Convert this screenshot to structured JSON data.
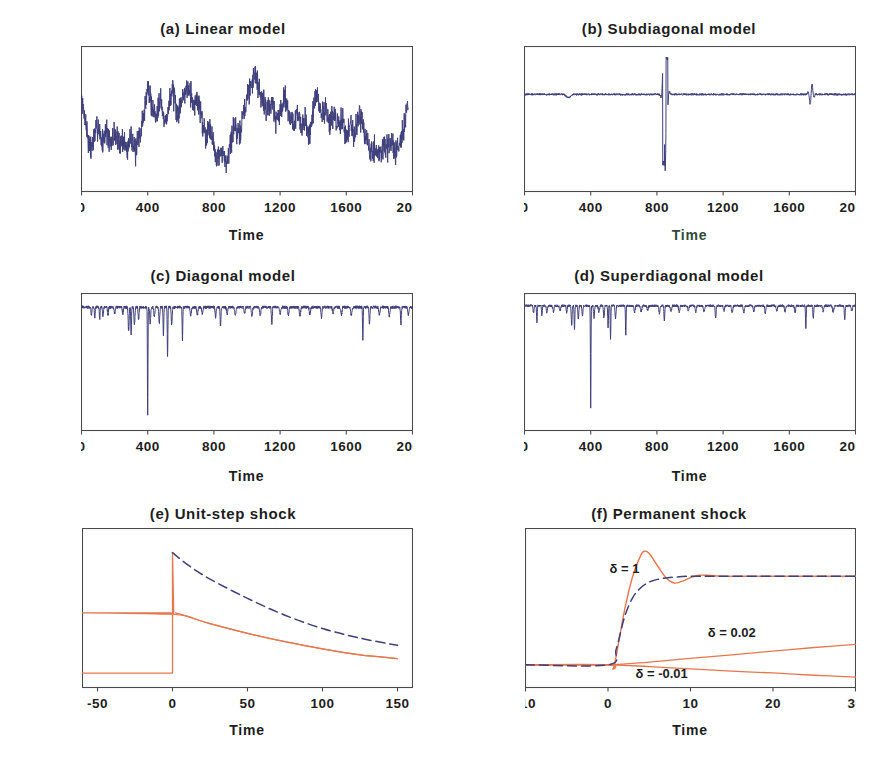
{
  "figure": {
    "background": "#ffffff",
    "series_colors": {
      "navy": "#3f3f7c",
      "orange": "#e8764c"
    }
  },
  "panels": [
    {
      "id": "a",
      "title": "(a) Linear model",
      "xlabel": "Time",
      "xticks": [
        "0",
        "400",
        "800",
        "1200",
        "1600",
        "2000"
      ],
      "yticks": [
        "20",
        "10",
        "0",
        "-10"
      ]
    },
    {
      "id": "b",
      "title": "(b) Subdiagonal model",
      "xlabel": "Time",
      "xticks": [
        "0",
        "400",
        "800",
        "1200",
        "1600",
        "2000"
      ],
      "yticks": [
        "200",
        "0",
        "-200",
        "-400",
        "-600"
      ]
    },
    {
      "id": "c",
      "title": "(c) Diagonal model",
      "xlabel": "Time",
      "xticks": [
        "0",
        "400",
        "800",
        "1200",
        "1600",
        "2000"
      ],
      "yticks": [
        "0",
        "-100",
        "-200",
        "-300",
        "-400"
      ]
    },
    {
      "id": "d",
      "title": "(d) Superdiagonal model",
      "xlabel": "Time",
      "xticks": [
        "0",
        "400",
        "800",
        "1200",
        "1600",
        "2000"
      ],
      "yticks": [
        "0",
        "-100",
        "-200",
        "-300",
        "-400",
        "-500"
      ]
    },
    {
      "id": "e",
      "title": "(e) Unit-step shock",
      "xlabel": "Time",
      "xticks": [
        "-50",
        "0",
        "50",
        "100",
        "150"
      ],
      "yticks": [
        "1.2",
        "1.0",
        "0.8",
        "0.6",
        "0.4",
        "0.2",
        "0.0"
      ]
    },
    {
      "id": "f",
      "title": "(f) Permanent shock",
      "xlabel": "Time",
      "xticks": [
        "-10",
        "0",
        "10",
        "20",
        "30"
      ],
      "yticks": [
        "3.0",
        "2.5",
        "2.0",
        "1.5",
        "1.0",
        "0.5",
        "0.0",
        "-0.5"
      ],
      "annotations": [
        {
          "text": "δ = 1",
          "x": 2.0,
          "y": 2.02
        },
        {
          "text": "δ = 0.02",
          "x": 15.0,
          "y": 0.62
        },
        {
          "text": "δ = -0.01",
          "x": 6.5,
          "y": -0.3
        }
      ]
    }
  ],
  "chart_data": [
    {
      "type": "line",
      "id": "a",
      "title": "(a) Linear model",
      "xlabel": "Time",
      "ylabel": "",
      "xlim": [
        0,
        2000
      ],
      "ylim": [
        -16,
        23
      ],
      "xticks": [
        0,
        400,
        800,
        1200,
        1600,
        2000
      ],
      "yticks": [
        20,
        10,
        0,
        -10
      ],
      "grid": false,
      "legend": "none",
      "series": [
        {
          "name": "linear model simulation",
          "color": "#3f3f7c",
          "style": "solid",
          "description": "Stationary random walk-like series oscillating roughly between -9 and +16 over 2000 time points.",
          "x": [
            0,
            25,
            50,
            75,
            100,
            125,
            150,
            175,
            200,
            225,
            250,
            275,
            300,
            325,
            350,
            375,
            400,
            425,
            450,
            475,
            500,
            525,
            550,
            575,
            600,
            625,
            650,
            675,
            700,
            725,
            750,
            775,
            800,
            825,
            850,
            875,
            900,
            925,
            950,
            975,
            1000,
            1025,
            1050,
            1075,
            1100,
            1125,
            1150,
            1175,
            1200,
            1225,
            1250,
            1275,
            1300,
            1325,
            1350,
            1375,
            1400,
            1425,
            1450,
            1475,
            1500,
            1525,
            1550,
            1575,
            1600,
            1625,
            1650,
            1675,
            1700,
            1725,
            1750,
            1775,
            1800,
            1825,
            1850,
            1875,
            1900,
            1925,
            1950,
            1975,
            2000
          ],
          "y": [
            8,
            3,
            -5,
            -2,
            2,
            -3,
            1,
            -4,
            0,
            -3,
            -2,
            -5,
            0,
            -6,
            -1,
            4,
            12,
            7,
            4,
            10,
            2,
            6,
            12,
            4,
            8,
            11,
            13,
            7,
            9,
            4,
            -1,
            2,
            -4,
            -7,
            -6,
            -8,
            -3,
            2,
            -2,
            4,
            9,
            13,
            16,
            11,
            8,
            6,
            9,
            3,
            5,
            10,
            6,
            2,
            5,
            1,
            3,
            -1,
            6,
            10,
            4,
            7,
            2,
            5,
            1,
            4,
            -2,
            3,
            -1,
            5,
            2,
            -3,
            -6,
            -4,
            -7,
            -3,
            -5,
            -2,
            -6,
            -2,
            2,
            7
          ]
        }
      ]
    },
    {
      "type": "line",
      "id": "b",
      "title": "(b) Subdiagonal model",
      "xlabel": "Time",
      "ylabel": "",
      "xlim": [
        0,
        2000
      ],
      "ylim": [
        -660,
        330
      ],
      "xticks": [
        0,
        400,
        800,
        1200,
        1600,
        2000
      ],
      "yticks": [
        200,
        0,
        -200,
        -400,
        -600
      ],
      "grid": false,
      "legend": "none",
      "series": [
        {
          "name": "subdiagonal model simulation",
          "color": "#3f3f7c",
          "style": "solid",
          "description": "Near-zero baseline with a large explosive burst near t=850 reaching -470 then +250, and a smaller burst near t=1730 reaching about +80.",
          "key_events": [
            {
              "t": 840,
              "value": -470,
              "label": "large negative spike"
            },
            {
              "t": 862,
              "value": 250,
              "label": "large positive spike"
            },
            {
              "t": 1730,
              "value": 80,
              "label": "secondary positive spike"
            }
          ]
        }
      ]
    },
    {
      "type": "line",
      "id": "c",
      "title": "(c) Diagonal model",
      "xlabel": "Time",
      "ylabel": "",
      "xlim": [
        0,
        2000
      ],
      "ylim": [
        -430,
        40
      ],
      "xticks": [
        0,
        400,
        800,
        1200,
        1600,
        2000
      ],
      "yticks": [
        0,
        -100,
        -200,
        -300,
        -400
      ],
      "grid": false,
      "legend": "none",
      "series": [
        {
          "name": "diagonal model simulation",
          "color": "#3f3f7c",
          "style": "solid",
          "description": "Baseline near zero with frequent downward spikes; largest spike -370 at t=400, secondary -170 at t=520, -110 near t=600 and t=1700.",
          "key_events": [
            {
              "t": 400,
              "value": -370,
              "label": "largest downward spike"
            },
            {
              "t": 520,
              "value": -170,
              "label": "second spike"
            },
            {
              "t": 610,
              "value": -110,
              "label": "third spike"
            },
            {
              "t": 1700,
              "value": -112,
              "label": "late spike"
            }
          ]
        }
      ]
    },
    {
      "type": "line",
      "id": "d",
      "title": "(d) Superdiagonal model",
      "xlabel": "Time",
      "ylabel": "",
      "xlim": [
        0,
        2000
      ],
      "ylim": [
        -535,
        45
      ],
      "xticks": [
        0,
        400,
        800,
        1200,
        1600,
        2000
      ],
      "yticks": [
        0,
        -100,
        -200,
        -300,
        -400,
        -500
      ],
      "grid": false,
      "legend": "none",
      "series": [
        {
          "name": "superdiagonal model simulation",
          "color": "#3f3f7c",
          "style": "solid",
          "description": "Baseline near zero with frequent downward spikes; largest spike -435 at t=400, secondary -140 at t=520, -125 at t=610, -95 near t=1700.",
          "key_events": [
            {
              "t": 400,
              "value": -435,
              "label": "largest downward spike"
            },
            {
              "t": 520,
              "value": -140,
              "label": "second spike"
            },
            {
              "t": 610,
              "value": -125,
              "label": "third spike"
            },
            {
              "t": 1700,
              "value": -95,
              "label": "late spike"
            }
          ]
        }
      ]
    },
    {
      "type": "line",
      "id": "e",
      "title": "(e) Unit-step shock",
      "xlabel": "Time",
      "ylabel": "",
      "xlim": [
        -60,
        160
      ],
      "ylim": [
        -0.12,
        1.2
      ],
      "xticks": [
        -50,
        0,
        50,
        100,
        150
      ],
      "yticks": [
        0.0,
        0.2,
        0.4,
        0.6,
        0.8,
        1.0,
        1.2
      ],
      "grid": false,
      "legend": "none",
      "series": [
        {
          "name": "linear response",
          "color": "#3f3f7c",
          "style": "dashed",
          "description": "Zero before t=0, jumps to 1.0 at t=0 then decays smoothly to about 0.23 at t=150.",
          "x": [
            -50,
            0,
            0,
            10,
            25,
            50,
            75,
            100,
            125,
            150
          ],
          "y": [
            0.0,
            0.0,
            1.0,
            0.9,
            0.78,
            0.62,
            0.48,
            0.37,
            0.29,
            0.23
          ]
        },
        {
          "name": "nonlinear response",
          "color": "#e8764c",
          "style": "solid",
          "description": "Zero before t=0, jumps to 1.0 at t=0, falls immediately to 0.50, then decays to about 0.12 at t=150.",
          "x": [
            -50,
            0,
            0,
            2,
            10,
            25,
            50,
            75,
            100,
            125,
            150
          ],
          "y": [
            0.0,
            0.0,
            1.0,
            0.5,
            0.47,
            0.41,
            0.33,
            0.26,
            0.2,
            0.15,
            0.12
          ]
        }
      ]
    },
    {
      "type": "line",
      "id": "f",
      "title": "(f) Permanent shock",
      "xlabel": "Time",
      "ylabel": "",
      "xlim": [
        -10,
        30
      ],
      "ylim": [
        -0.5,
        3.0
      ],
      "xticks": [
        -10,
        0,
        10,
        20,
        30
      ],
      "yticks": [
        -0.5,
        0.0,
        0.5,
        1.0,
        1.5,
        2.0,
        2.5,
        3.0
      ],
      "grid": false,
      "legend": "none",
      "annotations": [
        "δ = 1",
        "δ = 0.02",
        "δ = -0.01"
      ],
      "series": [
        {
          "name": "linear response (δ = 1)",
          "color": "#3f3f7c",
          "style": "dashed",
          "description": "Monotone rise from 0 at t=0 to the long-run level 1.95, no overshoot.",
          "x": [
            -10,
            0,
            1,
            2,
            3,
            4,
            5,
            6,
            7,
            8,
            10,
            12,
            14,
            20,
            30
          ],
          "y": [
            0.0,
            0.0,
            0.35,
            1.05,
            1.48,
            1.7,
            1.82,
            1.88,
            1.91,
            1.93,
            1.95,
            1.95,
            1.95,
            1.95,
            1.95
          ]
        },
        {
          "name": "nonlinear response (δ = 1)",
          "color": "#e8764c",
          "style": "solid",
          "description": "Small dip to -0.09 just after t=0, sharp rise overshooting to a peak of 2.50 at t=4.5, undershoot to 1.80 at t=8, settling at 1.95.",
          "x": [
            -10,
            0,
            0.6,
            1,
            2,
            3,
            4,
            4.5,
            5,
            6,
            7,
            8,
            9,
            10,
            11,
            12,
            14,
            20,
            30
          ],
          "y": [
            0.0,
            0.0,
            -0.09,
            0.2,
            1.2,
            1.95,
            2.42,
            2.5,
            2.45,
            2.18,
            1.92,
            1.8,
            1.84,
            1.92,
            1.97,
            1.97,
            1.95,
            1.95,
            1.95
          ]
        },
        {
          "name": "nonlinear response (δ = 0.02)",
          "color": "#e8764c",
          "style": "solid",
          "description": "Nearly linear upward drift from 0 at t=0 to about 0.45 at t=30.",
          "x": [
            -10,
            0,
            5,
            10,
            15,
            20,
            25,
            30
          ],
          "y": [
            0.0,
            0.0,
            0.06,
            0.14,
            0.22,
            0.3,
            0.38,
            0.45
          ]
        },
        {
          "name": "nonlinear response (δ = -0.01)",
          "color": "#e8764c",
          "style": "solid",
          "description": "Nearly linear downward drift from 0 at t=0 to about -0.27 at t=30.",
          "x": [
            -10,
            0,
            5,
            10,
            15,
            20,
            25,
            30
          ],
          "y": [
            0.0,
            0.0,
            -0.04,
            -0.09,
            -0.14,
            -0.18,
            -0.23,
            -0.27
          ]
        }
      ]
    }
  ]
}
